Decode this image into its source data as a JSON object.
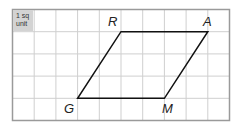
{
  "figure": {
    "unit_label_line1": "1 sq",
    "unit_label_line2": "unit",
    "grid": {
      "columns": 10,
      "rows": 5
    },
    "shape": "parallelogram",
    "vertices": {
      "R": {
        "label": "R",
        "grid": [
          5,
          1
        ]
      },
      "A": {
        "label": "A",
        "grid": [
          9,
          1
        ]
      },
      "M": {
        "label": "M",
        "grid": [
          7,
          4
        ]
      },
      "G": {
        "label": "G",
        "grid": [
          3,
          4
        ]
      }
    },
    "colors": {
      "grid": "#c8c8c8",
      "border": "#999999",
      "shape": "#111111",
      "unit_fill": "#d3d3d3"
    }
  }
}
